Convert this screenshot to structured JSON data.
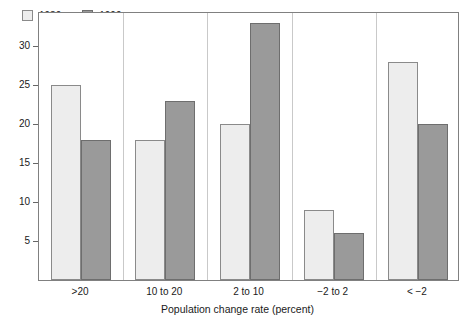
{
  "chart_data": {
    "type": "bar",
    "title": "",
    "subtitle": "",
    "xlabel": "Population change rate (percent)",
    "ylabel": "",
    "categories": [
      ">20",
      "10 to 20",
      "2 to 10",
      "−2 to 2",
      "< −2"
    ],
    "series": [
      {
        "name": "1980s",
        "values": [
          25,
          18,
          20,
          9,
          28
        ],
        "color": "#ededed"
      },
      {
        "name": "1990s",
        "values": [
          18,
          23,
          33,
          6,
          20
        ],
        "color": "#9a9a9a"
      }
    ],
    "ylim": [
      0,
      34.5
    ],
    "yticks": [
      5,
      10,
      15,
      20,
      25,
      30
    ],
    "ytick_labels": [
      "5",
      "10",
      "15",
      "20",
      "25",
      "30"
    ],
    "grid": false,
    "legend_position": "top-left-inside",
    "frame": true,
    "annotations": []
  },
  "legend": {
    "entries": [
      {
        "label": "1980s"
      },
      {
        "label": "1990s"
      }
    ]
  },
  "axes": {
    "x_title": "Population change rate (percent)"
  }
}
